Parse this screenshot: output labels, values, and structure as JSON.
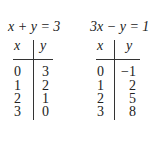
{
  "tables": [
    {
      "equation": "x + y = 3",
      "headers": {
        "x": "x",
        "y": "y"
      },
      "rows": [
        {
          "x": "0",
          "y": "3"
        },
        {
          "x": "1",
          "y": "2"
        },
        {
          "x": "2",
          "y": "1"
        },
        {
          "x": "3",
          "y": "0"
        }
      ]
    },
    {
      "equation": "3x − y = 1",
      "headers": {
        "x": "x",
        "y": "y"
      },
      "rows": [
        {
          "x": "0",
          "y": "−1"
        },
        {
          "x": "1",
          "y": "2"
        },
        {
          "x": "2",
          "y": "5"
        },
        {
          "x": "3",
          "y": "8"
        }
      ]
    }
  ]
}
